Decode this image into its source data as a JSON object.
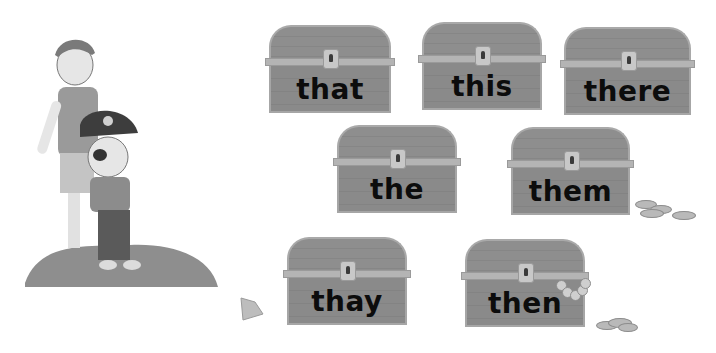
{
  "activity": {
    "description": "Pirate word chests sight-word activity",
    "chests": [
      {
        "word": "that",
        "x": 265,
        "y": 25,
        "w": 130,
        "h": 88
      },
      {
        "word": "this",
        "x": 418,
        "y": 22,
        "w": 128,
        "h": 88
      },
      {
        "word": "there",
        "x": 560,
        "y": 27,
        "w": 135,
        "h": 88
      },
      {
        "word": "the",
        "x": 333,
        "y": 125,
        "w": 128,
        "h": 88
      },
      {
        "word": "them",
        "x": 507,
        "y": 127,
        "w": 127,
        "h": 88
      },
      {
        "word": "thay",
        "x": 283,
        "y": 237,
        "w": 128,
        "h": 88
      },
      {
        "word": "then",
        "x": 461,
        "y": 239,
        "w": 128,
        "h": 88
      }
    ]
  },
  "colors": {
    "background": "#ffffff",
    "chest_body": "#8a8a8a",
    "chest_trim": "#a9a9a9",
    "word_text": "#0c0c0c",
    "rock": "#8c8c8c"
  }
}
